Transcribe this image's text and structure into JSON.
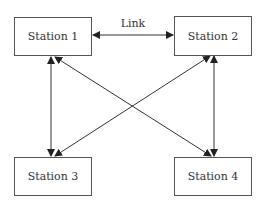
{
  "diagram": {
    "nodes": [
      {
        "id": "s1",
        "label": "Station 1"
      },
      {
        "id": "s2",
        "label": "Station 2"
      },
      {
        "id": "s3",
        "label": "Station 3"
      },
      {
        "id": "s4",
        "label": "Station 4"
      }
    ],
    "edges": [
      {
        "from": "s1",
        "to": "s2",
        "label": "Link",
        "direction": "bidirectional"
      },
      {
        "from": "s1",
        "to": "s3",
        "direction": "bidirectional"
      },
      {
        "from": "s1",
        "to": "s4",
        "direction": "bidirectional"
      },
      {
        "from": "s2",
        "to": "s3",
        "direction": "bidirectional"
      },
      {
        "from": "s2",
        "to": "s4",
        "direction": "bidirectional"
      }
    ],
    "link_label": "Link",
    "colors": {
      "line": "#333333",
      "box_border": "#555555",
      "text": "#333333"
    }
  }
}
